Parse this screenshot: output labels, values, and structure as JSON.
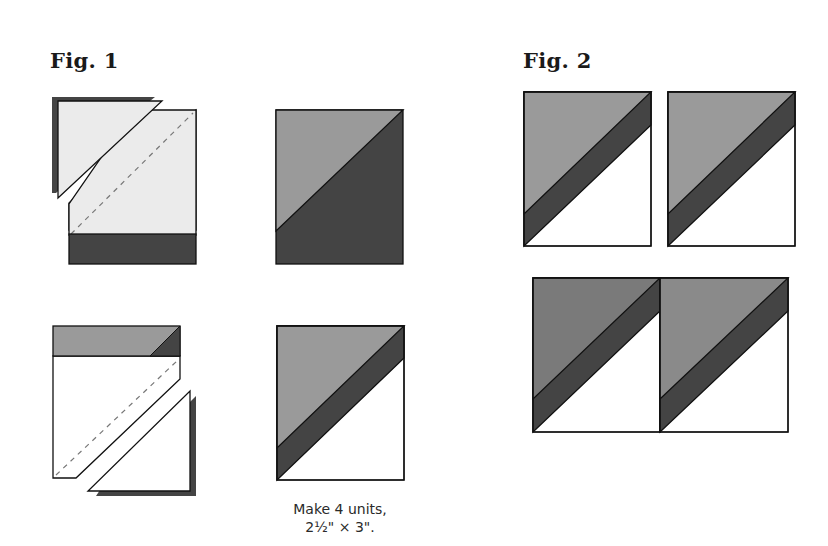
{
  "fig1": {
    "title": "Fig. 1",
    "caption_line1": "Make 4 units,",
    "caption_line2": "2½\" × 3\"."
  },
  "fig2": {
    "title": "Fig. 2"
  },
  "colors": {
    "light_fabric": "#ebebeb",
    "medium_fabric": "#9a9a9a",
    "dark_fabric": "#444444",
    "background_fabric": "#ffffff",
    "outline": "#111111",
    "stitch_line": "#777777"
  }
}
